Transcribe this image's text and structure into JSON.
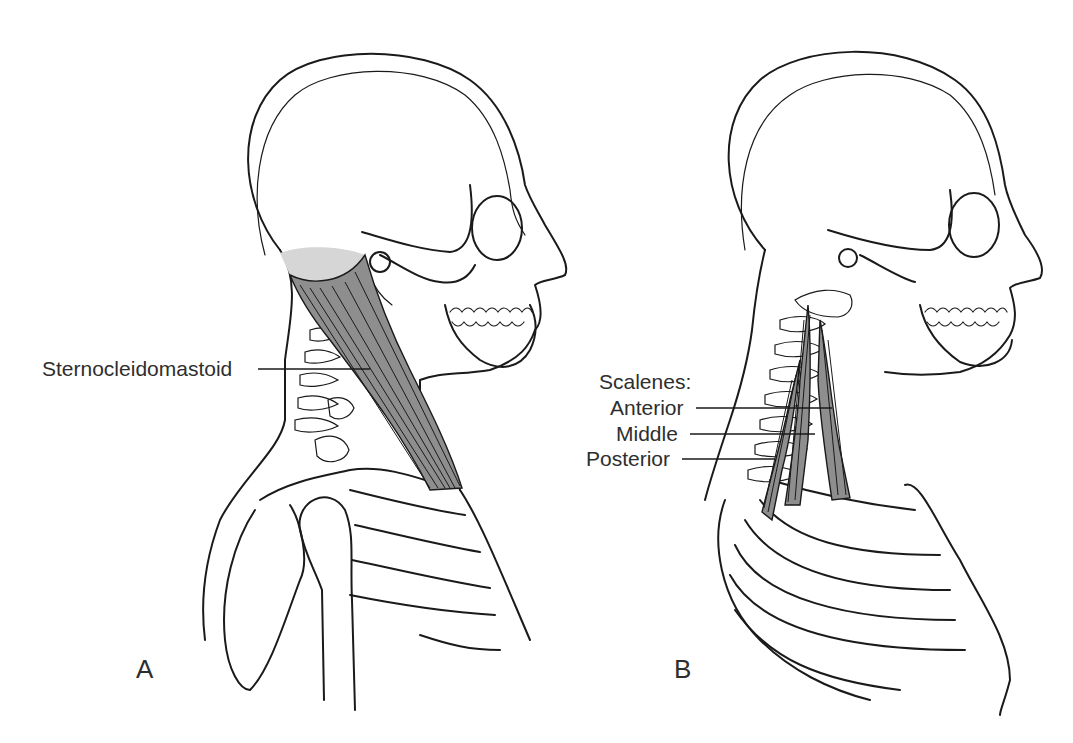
{
  "figure": {
    "panels": [
      {
        "id": "A",
        "letter": "A",
        "view": "lateral view of head, neck and shoulder",
        "labels": [
          {
            "text": "Sternocleidomastoid",
            "target": "sternocleidomastoid-muscle"
          }
        ],
        "colors": {
          "muscle": "#8e8e8e",
          "muscle_origin": "#d6d6d6",
          "outline": "#1a1a1a"
        }
      },
      {
        "id": "B",
        "letter": "B",
        "view": "lateral view of head, neck and ribcage",
        "group_label": "Scalenes:",
        "labels": [
          {
            "text": "Anterior",
            "target": "anterior-scalene"
          },
          {
            "text": "Middle",
            "target": "middle-scalene"
          },
          {
            "text": "Posterior",
            "target": "posterior-scalene"
          }
        ],
        "colors": {
          "muscle": "#8e8e8e",
          "outline": "#1a1a1a"
        }
      }
    ]
  }
}
